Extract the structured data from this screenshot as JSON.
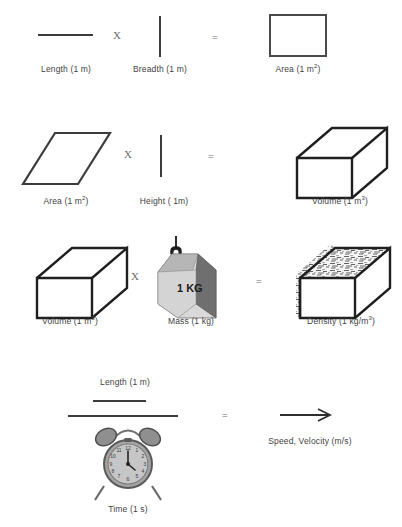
{
  "figure": {
    "rows": [
      {
        "id": "row-length-breadth-area",
        "operator_1": "X",
        "operator_2": "=",
        "terms": [
          {
            "name": "length",
            "label": "Length (1 m)",
            "icon": "horizontal-line-shape"
          },
          {
            "name": "breadth",
            "label": "Breadth (1 m)",
            "icon": "vertical-line-shape"
          },
          {
            "name": "area",
            "label_text": "Area (1 m",
            "label_sup": "2",
            "label_tail": ")",
            "icon": "rectangle-shape"
          }
        ]
      },
      {
        "id": "row-area-height-volume",
        "operator_1": "X",
        "operator_2": "=",
        "terms": [
          {
            "name": "area",
            "label_text": "Area (1 m",
            "label_sup": "2",
            "label_tail": ")",
            "icon": "parallelogram-shape"
          },
          {
            "name": "height",
            "label": "Height ( 1m)",
            "icon": "vertical-line-shape"
          },
          {
            "name": "volume",
            "label_text": "Volume (1 m",
            "label_sup": "3",
            "label_tail": ")",
            "icon": "wireframe-box-shape"
          }
        ]
      },
      {
        "id": "row-volume-mass-density",
        "operator_1": "X",
        "operator_2": "=",
        "terms": [
          {
            "name": "volume",
            "label_text": "Volume (1 m",
            "label_sup": "3",
            "label_tail": ")",
            "icon": "wireframe-box-shape"
          },
          {
            "name": "mass",
            "label": "Mass (1 kg)",
            "icon": "weight-block-icon",
            "block_label": "1 KG"
          },
          {
            "name": "density",
            "label_text": "Density (1 kg/m",
            "label_sup": "3",
            "label_tail": ")",
            "icon": "textured-box-shape"
          }
        ]
      },
      {
        "id": "row-length-over-time-speed",
        "operator_2": "=",
        "terms": [
          {
            "name": "length-numerator",
            "label": "Length (1 m)",
            "icon": "horizontal-line-shape"
          },
          {
            "name": "time-denominator",
            "label": "Time (1 s)",
            "icon": "alarm-clock-icon"
          },
          {
            "name": "speed",
            "label": "Speed, Velocity (m/s)",
            "icon": "right-arrow-shape"
          }
        ]
      }
    ]
  },
  "colors": {
    "ink": "#3c3c3c",
    "caption": "#3f3f3f",
    "operator": "#6d6d6d",
    "outline": "#4a4a4a",
    "weight_front": "#d9d9d9",
    "weight_top": "#b6b6b6",
    "weight_side": "#6f6f6f",
    "clock_body": "#9a9a9a",
    "background": "#ffffff"
  }
}
